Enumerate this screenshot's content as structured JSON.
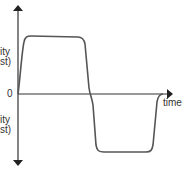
{
  "diagram": {
    "type": "velocity-time graph",
    "axis_color": "#333333",
    "curve_color": "#555555",
    "labels": {
      "origin": "0",
      "x_axis": "time",
      "y_positive_line1": "ity",
      "y_positive_line2": "st)",
      "y_negative_line1": "ity",
      "y_negative_line2": "st)"
    }
  }
}
